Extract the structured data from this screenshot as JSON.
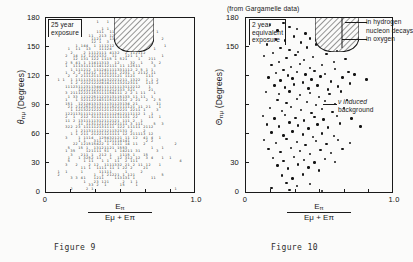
{
  "document": {
    "background_color": "#fbfbfa",
    "ink_color": "#1a1a1a"
  },
  "chart_data": [
    {
      "id": "figure-9",
      "type": "scatter",
      "title": "",
      "caption": "Figure 9",
      "xlabel_numerator": "E",
      "xlabel_numerator_sub": "π",
      "xlabel_denominator": "Eμ + Eπ",
      "ylabel": "θ",
      "ylabel_sub": "πμ",
      "ylabel_units": "(Degrees)",
      "xlim": [
        0,
        1.0
      ],
      "ylim": [
        0,
        180
      ],
      "xticks": [
        0,
        1.0
      ],
      "xtick_labels": [
        "0",
        "1.0"
      ],
      "xtick_count": 6,
      "yticks": [
        0,
        30,
        60,
        90,
        120,
        150,
        180
      ],
      "ytick_labels": [
        "0",
        "30",
        "60",
        "90",
        "120",
        "150",
        "180"
      ],
      "grid": false,
      "annotation_box": "25 year\nexposure",
      "annotation_box_lines": [
        "25 year",
        "exposure"
      ],
      "hatched_region": {
        "label": "nucleon decay signal region",
        "x_range": [
          0.46,
          0.72
        ],
        "y_top": 180,
        "y_bottom": 146
      },
      "marker_style": "printed-digit-counts",
      "note": "density plot rendered as per-bin digit counts"
    },
    {
      "id": "figure-10",
      "type": "scatter",
      "title": "(from Gargamelle data)",
      "caption": "Figure 10",
      "xlabel_numerator": "E",
      "xlabel_numerator_sub": "π",
      "xlabel_denominator": "Eμ + Eπ",
      "ylabel": "Θ",
      "ylabel_sub": "πμ",
      "ylabel_units": "(Degrees)",
      "xlim": [
        0,
        1.0
      ],
      "ylim": [
        0,
        180
      ],
      "xticks": [
        0,
        1.0
      ],
      "xtick_labels": [
        "0",
        "1.0"
      ],
      "xtick_count": 6,
      "yticks": [
        0,
        30,
        60,
        90,
        120,
        150,
        180
      ],
      "ytick_labels_visible": [
        "0",
        "30",
        "150",
        "180"
      ],
      "grid": false,
      "annotation_box_lines": [
        "2 year",
        "equivalent",
        "exposure"
      ],
      "callouts": [
        {
          "name": "in-hydrogen",
          "text": "in hydrogen"
        },
        {
          "name": "nucleon-decays",
          "text": "nucleon decays"
        },
        {
          "name": "in-oxygen",
          "text": "in oxygen"
        },
        {
          "name": "nu-induced-background",
          "text": "ν induced",
          "text2": "background"
        }
      ],
      "hatched_region": {
        "x_range": [
          0.47,
          0.76
        ],
        "y_top": 180,
        "y_bottom": 147
      },
      "marker_style": "filled-circle",
      "points": [
        [
          0.17,
          172
        ],
        [
          0.26,
          174
        ],
        [
          0.3,
          170
        ],
        [
          0.22,
          166
        ],
        [
          0.35,
          168
        ],
        [
          0.41,
          163
        ],
        [
          0.21,
          157
        ],
        [
          0.27,
          156
        ],
        [
          0.33,
          160
        ],
        [
          0.15,
          152
        ],
        [
          0.38,
          154
        ],
        [
          0.44,
          158
        ],
        [
          0.24,
          148
        ],
        [
          0.3,
          146
        ],
        [
          0.19,
          143
        ],
        [
          0.36,
          144
        ],
        [
          0.42,
          149
        ],
        [
          0.48,
          152
        ],
        [
          0.13,
          140
        ],
        [
          0.28,
          138
        ],
        [
          0.34,
          141
        ],
        [
          0.23,
          134
        ],
        [
          0.4,
          136
        ],
        [
          0.46,
          139
        ],
        [
          0.55,
          142
        ],
        [
          0.62,
          145
        ],
        [
          0.18,
          131
        ],
        [
          0.31,
          129
        ],
        [
          0.37,
          132
        ],
        [
          0.26,
          126
        ],
        [
          0.44,
          128
        ],
        [
          0.52,
          131
        ],
        [
          0.6,
          134
        ],
        [
          0.68,
          137
        ],
        [
          0.21,
          123
        ],
        [
          0.29,
          120
        ],
        [
          0.35,
          124
        ],
        [
          0.41,
          121
        ],
        [
          0.47,
          125
        ],
        [
          0.54,
          122
        ],
        [
          0.61,
          127
        ],
        [
          0.7,
          124
        ],
        [
          0.16,
          118
        ],
        [
          0.24,
          115
        ],
        [
          0.32,
          117
        ],
        [
          0.39,
          113
        ],
        [
          0.45,
          116
        ],
        [
          0.51,
          119
        ],
        [
          0.58,
          114
        ],
        [
          0.66,
          118
        ],
        [
          0.74,
          121
        ],
        [
          0.82,
          116
        ],
        [
          0.2,
          110
        ],
        [
          0.27,
          108
        ],
        [
          0.33,
          111
        ],
        [
          0.43,
          107
        ],
        [
          0.49,
          110
        ],
        [
          0.56,
          106
        ],
        [
          0.63,
          109
        ],
        [
          0.71,
          112
        ],
        [
          0.14,
          103
        ],
        [
          0.23,
          101
        ],
        [
          0.3,
          104
        ],
        [
          0.37,
          100
        ],
        [
          0.44,
          102
        ],
        [
          0.5,
          98
        ],
        [
          0.57,
          101
        ],
        [
          0.65,
          104
        ],
        [
          0.22,
          95
        ],
        [
          0.28,
          92
        ],
        [
          0.35,
          96
        ],
        [
          0.42,
          93
        ],
        [
          0.48,
          90
        ],
        [
          0.54,
          94
        ],
        [
          0.61,
          91
        ],
        [
          0.69,
          95
        ],
        [
          0.17,
          87
        ],
        [
          0.25,
          84
        ],
        [
          0.31,
          88
        ],
        [
          0.38,
          85
        ],
        [
          0.45,
          82
        ],
        [
          0.52,
          86
        ],
        [
          0.59,
          83
        ],
        [
          0.67,
          87
        ],
        [
          0.12,
          79
        ],
        [
          0.2,
          76
        ],
        [
          0.27,
          80
        ],
        [
          0.34,
          77
        ],
        [
          0.4,
          74
        ],
        [
          0.47,
          78
        ],
        [
          0.53,
          75
        ],
        [
          0.62,
          79
        ],
        [
          0.72,
          76
        ],
        [
          0.15,
          70
        ],
        [
          0.23,
          68
        ],
        [
          0.3,
          72
        ],
        [
          0.36,
          69
        ],
        [
          0.43,
          66
        ],
        [
          0.49,
          70
        ],
        [
          0.56,
          67
        ],
        [
          0.64,
          71
        ],
        [
          0.78,
          68
        ],
        [
          0.18,
          62
        ],
        [
          0.26,
          59
        ],
        [
          0.32,
          63
        ],
        [
          0.39,
          60
        ],
        [
          0.46,
          57
        ],
        [
          0.52,
          61
        ],
        [
          0.6,
          58
        ],
        [
          0.13,
          54
        ],
        [
          0.21,
          51
        ],
        [
          0.28,
          55
        ],
        [
          0.35,
          52
        ],
        [
          0.41,
          49
        ],
        [
          0.48,
          53
        ],
        [
          0.55,
          50
        ],
        [
          0.63,
          54
        ],
        [
          0.71,
          51
        ],
        [
          0.16,
          45
        ],
        [
          0.24,
          42
        ],
        [
          0.31,
          46
        ],
        [
          0.37,
          43
        ],
        [
          0.44,
          40
        ],
        [
          0.51,
          44
        ],
        [
          0.58,
          41
        ],
        [
          0.66,
          45
        ],
        [
          0.19,
          36
        ],
        [
          0.26,
          33
        ],
        [
          0.33,
          37
        ],
        [
          0.4,
          34
        ],
        [
          0.47,
          31
        ],
        [
          0.54,
          35
        ],
        [
          0.61,
          32
        ],
        [
          0.22,
          28
        ],
        [
          0.29,
          25
        ],
        [
          0.36,
          29
        ],
        [
          0.43,
          26
        ],
        [
          0.5,
          23
        ],
        [
          0.25,
          18
        ],
        [
          0.32,
          15
        ],
        [
          0.39,
          19
        ],
        [
          0.28,
          10
        ],
        [
          0.35,
          7
        ],
        [
          0.44,
          9
        ],
        [
          0.3,
          3
        ],
        [
          0.52,
          2
        ],
        [
          0.18,
          5
        ]
      ]
    }
  ],
  "captions": {
    "left": "Figure 9",
    "right": "Figure 10"
  }
}
